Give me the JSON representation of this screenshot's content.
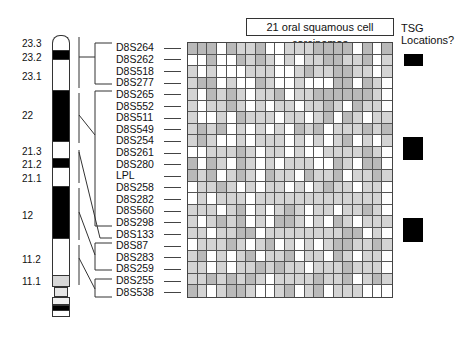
{
  "title": "21 oral squamous cell carcinomas",
  "tsg": {
    "label_line1": "TSG",
    "label_line2": "Locations?",
    "blocks": [
      {
        "top": 54,
        "height": 12
      },
      {
        "top": 137,
        "height": 23
      },
      {
        "top": 218,
        "height": 24
      }
    ]
  },
  "chromosome": {
    "bands": [
      {
        "label": "23.3",
        "y": 44
      },
      {
        "label": "23.2",
        "y": 58
      },
      {
        "label": "23.1",
        "y": 75
      },
      {
        "label": "22",
        "y": 114
      },
      {
        "label": "21.3",
        "y": 150
      },
      {
        "label": "21.2",
        "y": 163
      },
      {
        "label": "21.1",
        "y": 177
      },
      {
        "label": "12",
        "y": 214
      },
      {
        "label": "11.2",
        "y": 258
      },
      {
        "label": "11.1",
        "y": 280
      }
    ]
  },
  "markers": [
    "D8S264",
    "D8S262",
    "D8S518",
    "D8S277",
    "D8S265",
    "D8S552",
    "D8S511",
    "D8S549",
    "D8S254",
    "D8S261",
    "D8S280",
    "LPL",
    "D8S258",
    "D8S282",
    "D8S560",
    "D8S298",
    "D8S133",
    "D8S87",
    "D8S283",
    "D8S259",
    "D8S255",
    "D8S538"
  ],
  "legend_colors": {
    "W": "#ffffff",
    "L": "#d4d4d4",
    "G": "#b9b9b9"
  },
  "grid_rows": [
    "GGGWGLLGWWLLLGGGGWGWG",
    "WWGWWGLGLWLWLLGGLLGWL",
    "LWLWWWLLLWWLGLLGGLLWL",
    "LGGWLWWGLWWLWWWGGWGLW",
    "LWGLGLWLLGWLLGGGGGGLW",
    "LWLLGLWLWLLWLLGLWGLLW",
    "LWWLWGLLLWLLWLGWGLWLL",
    "LGLGWLWLWLWGLGWLLLGLG",
    "LGLWWLWLLLWLWLWLGWLWL",
    "WWLLLGLWLLWLWWLLLLGLW",
    "GWGLWGLWLWLLLWWGLWGGW",
    "GLGWLGLWGLLWGLLGWLLGL",
    "WLLGLWLWLLWLWLGLLWLLW",
    "WLWLLLWLLLLLLLLLLLLLW",
    "LLLWLGWLWLGLWLLWLLGLW",
    "LWLGLGWLWGGLWLWGLWLLL",
    "LLWLLGGWLLLLLLLLGGWLW",
    "WLLLGLWLGWLWLWLGGLLGL",
    "LGWLWLGWLLGWLLWGLWLLW",
    "LLWLWLLGLGLLWLLLGLLLW",
    "LLGLGLGLWLLLLGLLGWLGL",
    "GLWLGGLWWLGWLGWLLLWWW"
  ]
}
